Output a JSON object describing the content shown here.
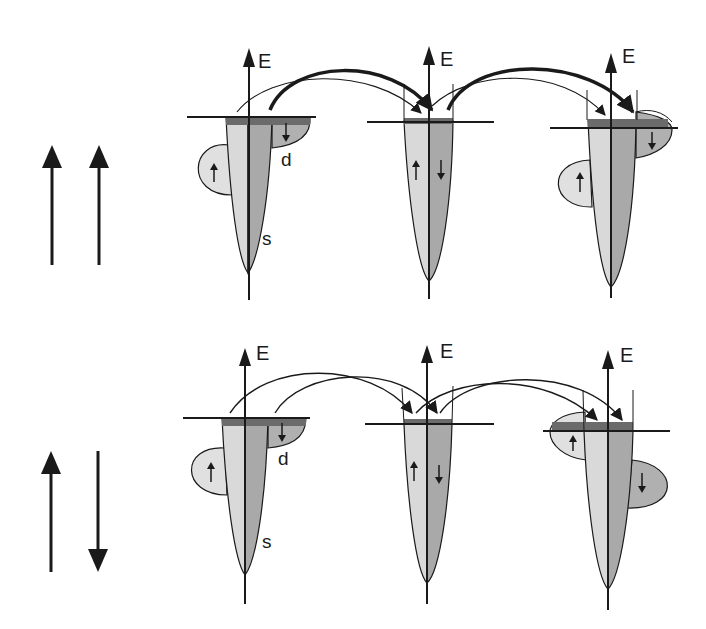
{
  "diagram": {
    "type": "spin-dependent band structure / electron transfer",
    "colors": {
      "spin_up_band": "#d9d9d9",
      "spin_down_band": "#a9a9a9",
      "filled_states": "#6b6b6b",
      "stroke": "#1a1a1a",
      "d_band_up": "#e0e0e0",
      "d_band_down": "#b0b0b0"
    },
    "labels": {
      "energy_axis": "E",
      "d_band": "d",
      "s_band": "s"
    },
    "rows": [
      {
        "name": "parallel",
        "magnetization_arrows": [
          "up",
          "up"
        ],
        "panels": [
          {
            "role": "left-electrode",
            "d_band": "exchange-split",
            "labels": [
              "d",
              "s"
            ]
          },
          {
            "role": "spacer",
            "d_band": "none",
            "labels": []
          },
          {
            "role": "right-electrode",
            "d_band": "exchange-split",
            "labels": []
          }
        ],
        "transfer_arrows": "thick (majority channel) and thin (minority channel)"
      },
      {
        "name": "antiparallel",
        "magnetization_arrows": [
          "up",
          "down"
        ],
        "panels": [
          {
            "role": "left-electrode",
            "d_band": "exchange-split",
            "labels": [
              "d",
              "s"
            ]
          },
          {
            "role": "spacer",
            "d_band": "none",
            "labels": []
          },
          {
            "role": "right-electrode",
            "d_band": "exchange-split (reversed)",
            "labels": []
          }
        ],
        "transfer_arrows": "thin (equal channels)"
      }
    ]
  }
}
